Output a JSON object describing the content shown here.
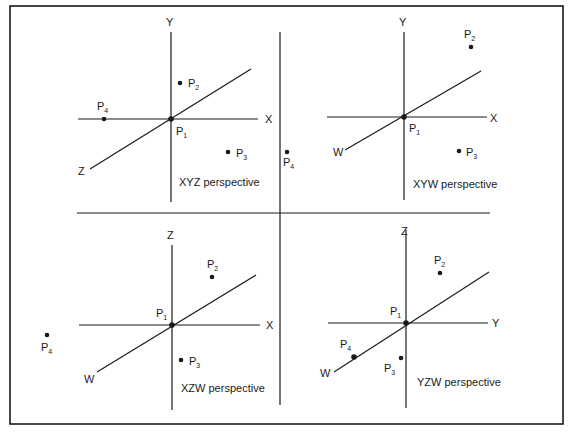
{
  "figure": {
    "panels": [
      {
        "caption": "XYZ perspective",
        "axes": {
          "vertical": "Y",
          "horizontal": "X",
          "oblique": "Z"
        },
        "points": [
          {
            "label": "P",
            "sub": "1"
          },
          {
            "label": "P",
            "sub": "2"
          },
          {
            "label": "P",
            "sub": "3"
          },
          {
            "label": "P",
            "sub": "4"
          }
        ]
      },
      {
        "caption": "XYW perspective",
        "axes": {
          "vertical": "Y",
          "horizontal": "X",
          "oblique": "W"
        },
        "points": [
          {
            "label": "P",
            "sub": "1"
          },
          {
            "label": "P",
            "sub": "2"
          },
          {
            "label": "P",
            "sub": "3"
          },
          {
            "label": "P",
            "sub": "4"
          }
        ]
      },
      {
        "caption": "XZW perspective",
        "axes": {
          "vertical": "Z",
          "horizontal": "X",
          "oblique": "W"
        },
        "points": [
          {
            "label": "P",
            "sub": "1"
          },
          {
            "label": "P",
            "sub": "2"
          },
          {
            "label": "P",
            "sub": "3"
          },
          {
            "label": "P",
            "sub": "4"
          }
        ]
      },
      {
        "caption": "YZW perspective",
        "axes": {
          "vertical": "Z",
          "horizontal": "Y",
          "oblique": "W"
        },
        "points": [
          {
            "label": "P",
            "sub": "1"
          },
          {
            "label": "P",
            "sub": "2"
          },
          {
            "label": "P",
            "sub": "3"
          },
          {
            "label": "P",
            "sub": "4"
          }
        ]
      }
    ]
  }
}
